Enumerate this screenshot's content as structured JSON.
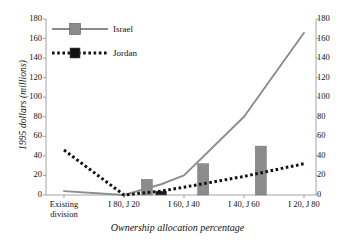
{
  "chart_data": {
    "type": "line",
    "title": "",
    "xlabel": "Ownership allocation percentage",
    "ylabel": "1995 dollars (millions)",
    "ylim": [
      0,
      180
    ],
    "yticks": [
      0,
      20,
      40,
      60,
      80,
      100,
      120,
      140,
      160,
      180
    ],
    "y2lim": [
      0,
      180
    ],
    "y2ticks": [
      0,
      20,
      40,
      60,
      80,
      100,
      120,
      140,
      160,
      180
    ],
    "grid": false,
    "legend_position": "upper-left-inside",
    "categories": [
      "Existing division",
      "I 80, J 20",
      "I 60, J 40",
      "I 40, J 60",
      "I 20, J 80"
    ],
    "series": [
      {
        "name": "Israel",
        "kind": "line",
        "style": "solid",
        "color": "#8c8c8c",
        "x": [
          0.0,
          1.0,
          1.62,
          2.0,
          3.0,
          4.0
        ],
        "values": [
          4,
          0,
          11,
          20,
          80,
          166
        ]
      },
      {
        "name": "Jordan",
        "kind": "line",
        "style": "dotted",
        "color": "#111111",
        "x": [
          0.0,
          1.0,
          1.62,
          2.0,
          3.0,
          4.0
        ],
        "values": [
          46,
          0,
          4,
          8,
          19,
          32
        ]
      }
    ],
    "bars": [
      {
        "x": 1.38,
        "value": 16,
        "color": "#8c8c8c",
        "series": "Israel"
      },
      {
        "x": 1.62,
        "value": 4,
        "color": "#1a1a1a",
        "series": "Jordan"
      },
      {
        "x": 2.32,
        "value": 32,
        "color": "#8c8c8c",
        "series": "Israel"
      },
      {
        "x": 3.28,
        "value": 50,
        "color": "#8c8c8c",
        "series": "Israel"
      }
    ],
    "ytick_labels": [
      "180",
      "160",
      "140",
      "120",
      "100",
      "80",
      "60",
      "40",
      "20",
      "0"
    ],
    "y2tick_labels": [
      "180",
      "160",
      "140",
      "120",
      "100",
      "80",
      "60",
      "40",
      "20",
      "0"
    ]
  },
  "legend": {
    "items": [
      {
        "label": "Israel",
        "color": "#8c8c8c",
        "style": "solid"
      },
      {
        "label": "Jordan",
        "color": "#111111",
        "style": "dotted"
      }
    ]
  },
  "axes": {
    "y_title": "1995 dollars (millions)",
    "x_title": "Ownership allocation percentage",
    "x_categories": [
      {
        "line1": "Existing",
        "line2": "division"
      },
      {
        "line1": "I 80, J 20",
        "line2": ""
      },
      {
        "line1": "I 60, J 40",
        "line2": ""
      },
      {
        "line1": "I 40, J 60",
        "line2": ""
      },
      {
        "line1": "I 20, J 80",
        "line2": ""
      }
    ]
  }
}
